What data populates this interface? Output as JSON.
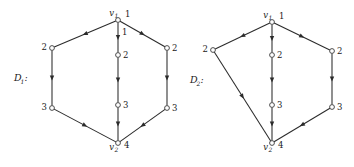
{
  "figure": {
    "background_color": "#ffffff",
    "line_color": "#2b2b2b",
    "node_fill": "#ffffff",
    "node_stroke": "#3a3a3a",
    "diagrams": [
      {
        "id": "D1",
        "label": "D",
        "label_sub": "1",
        "label_colon": ":",
        "label_full": "D₁:",
        "shape": "hexagon-with-central-path",
        "nodes": [
          {
            "key": "v1",
            "name": "v",
            "name_sub": "1",
            "level": "1",
            "x": 118,
            "y": 20,
            "label_side": "top"
          },
          {
            "key": "left2",
            "name": "",
            "name_sub": "",
            "level": "2",
            "x": 52,
            "y": 48,
            "label_side": "left"
          },
          {
            "key": "mid2",
            "name": "",
            "name_sub": "",
            "level": "2",
            "x": 118,
            "y": 55,
            "label_side": "right"
          },
          {
            "key": "right2",
            "name": "",
            "name_sub": "",
            "level": "2",
            "x": 167,
            "y": 48,
            "label_side": "right"
          },
          {
            "key": "left3",
            "name": "",
            "name_sub": "",
            "level": "3",
            "x": 52,
            "y": 108,
            "label_side": "left"
          },
          {
            "key": "mid3",
            "name": "",
            "name_sub": "",
            "level": "3",
            "x": 118,
            "y": 105,
            "label_side": "right"
          },
          {
            "key": "right3",
            "name": "",
            "name_sub": "",
            "level": "3",
            "x": 167,
            "y": 108,
            "label_side": "right"
          },
          {
            "key": "v2",
            "name": "v",
            "name_sub": "2",
            "level": "4",
            "x": 118,
            "y": 143,
            "label_side": "bottom"
          }
        ],
        "edges": [
          {
            "from": "v1",
            "to": "left2",
            "arrow_at": "mid"
          },
          {
            "from": "v1",
            "to": "mid2",
            "arrow_at": "mid",
            "edge_label": "1"
          },
          {
            "from": "v1",
            "to": "right2",
            "arrow_at": "mid"
          },
          {
            "from": "left2",
            "to": "left3",
            "arrow_at": "mid"
          },
          {
            "from": "mid2",
            "to": "mid3",
            "arrow_at": "mid"
          },
          {
            "from": "right2",
            "to": "right3",
            "arrow_at": "mid"
          },
          {
            "from": "left3",
            "to": "v2",
            "arrow_at": "mid"
          },
          {
            "from": "mid3",
            "to": "v2",
            "arrow_at": "mid"
          },
          {
            "from": "right3",
            "to": "v2",
            "arrow_at": "mid"
          }
        ]
      },
      {
        "id": "D2",
        "label": "D",
        "label_sub": "2",
        "label_colon": ":",
        "label_full": "D₂:",
        "shape": "quadrilateral-with-central-path",
        "nodes": [
          {
            "key": "v1",
            "name": "v",
            "name_sub": "1",
            "level": "1",
            "x": 272,
            "y": 22,
            "label_side": "top"
          },
          {
            "key": "left2",
            "name": "",
            "name_sub": "",
            "level": "2",
            "x": 213,
            "y": 50,
            "label_side": "left"
          },
          {
            "key": "mid2",
            "name": "",
            "name_sub": "",
            "level": "2",
            "x": 272,
            "y": 55,
            "label_side": "right"
          },
          {
            "key": "right2",
            "name": "",
            "name_sub": "",
            "level": "2",
            "x": 332,
            "y": 51,
            "label_side": "right"
          },
          {
            "key": "mid3",
            "name": "",
            "name_sub": "",
            "level": "3",
            "x": 272,
            "y": 105,
            "label_side": "right"
          },
          {
            "key": "right3",
            "name": "",
            "name_sub": "",
            "level": "3",
            "x": 332,
            "y": 107,
            "label_side": "right"
          },
          {
            "key": "v2",
            "name": "v",
            "name_sub": "2",
            "level": "4",
            "x": 272,
            "y": 143,
            "label_side": "bottom"
          }
        ],
        "edges": [
          {
            "from": "v1",
            "to": "left2",
            "arrow_at": "mid"
          },
          {
            "from": "v1",
            "to": "mid2",
            "arrow_at": "mid"
          },
          {
            "from": "v1",
            "to": "right2",
            "arrow_at": "mid"
          },
          {
            "from": "left2",
            "to": "v2",
            "arrow_at": "mid"
          },
          {
            "from": "mid2",
            "to": "mid3",
            "arrow_at": "mid"
          },
          {
            "from": "right2",
            "to": "right3",
            "arrow_at": "mid"
          },
          {
            "from": "mid3",
            "to": "v2",
            "arrow_at": "mid"
          },
          {
            "from": "right3",
            "to": "v2",
            "arrow_at": "mid"
          }
        ]
      }
    ]
  }
}
